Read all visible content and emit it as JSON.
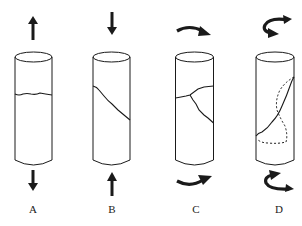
{
  "figure": {
    "panels": [
      {
        "id": "A",
        "label": "A",
        "loading": "tension",
        "top_arrow": "up-arrow",
        "bottom_arrow": "down-arrow",
        "fracture": "transverse-wavy-crack"
      },
      {
        "id": "B",
        "label": "B",
        "loading": "compression",
        "top_arrow": "down-arrow",
        "bottom_arrow": "up-arrow",
        "fracture": "oblique-shear-crack"
      },
      {
        "id": "C",
        "label": "C",
        "loading": "torsion",
        "top_arrow": "curved-arrow-clockwise",
        "bottom_arrow": "curved-arrow-counter",
        "fracture": "branching-crack"
      },
      {
        "id": "D",
        "label": "D",
        "loading": "torsion",
        "top_arrow": "hook-arrow-left",
        "bottom_arrow": "hook-arrow-right",
        "fracture": "helical-crack-with-dashed-back"
      }
    ]
  },
  "colors": {
    "stroke": "#1a1a1a",
    "background": "#ffffff"
  }
}
